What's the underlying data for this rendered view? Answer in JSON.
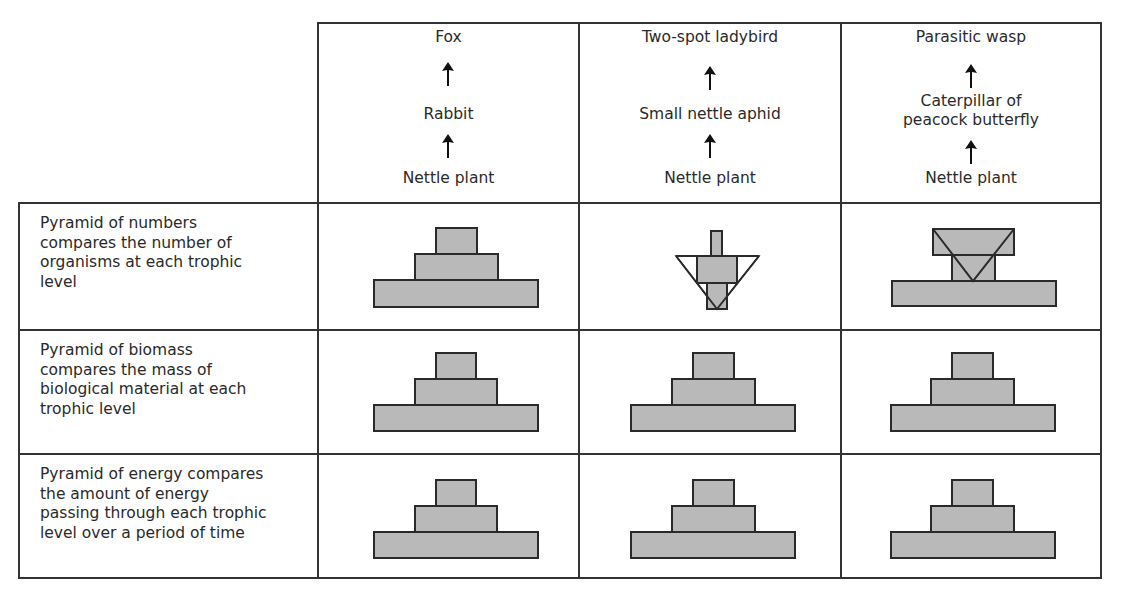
{
  "table": {
    "food_chains": [
      {
        "name": "chain-fox",
        "levels": [
          "Nettle plant",
          "Rabbit",
          "Fox"
        ]
      },
      {
        "name": "chain-ladybird",
        "levels": [
          "Nettle plant",
          "Small nettle aphid",
          "Two-spot ladybird"
        ]
      },
      {
        "name": "chain-wasp",
        "levels": [
          "Nettle plant",
          "Caterpillar of peacock butterfly",
          "Parasitic wasp"
        ],
        "display_lines": {
          "middle_line1": "Caterpillar of",
          "middle_line2": "peacock butterfly"
        }
      }
    ],
    "rows": [
      {
        "label": "Pyramid of numbers compares the number of organisms at each trophic level",
        "label_lines": [
          "Pyramid of numbers",
          "compares the number of",
          "organisms at each trophic",
          "level"
        ],
        "pyramids": [
          "upright",
          "inverted",
          "spindle-inverted"
        ]
      },
      {
        "label": "Pyramid of biomass compares the mass of biological material at each trophic level",
        "label_lines": [
          "Pyramid of biomass",
          "compares the mass of",
          "biological material at each",
          "trophic level"
        ],
        "pyramids": [
          "upright",
          "upright",
          "upright"
        ]
      },
      {
        "label": "Pyramid of energy compares the amount of energy passing through each trophic level over a period of time",
        "label_lines": [
          "Pyramid of energy compares",
          "the amount of energy",
          "passing through each trophic",
          "level over a period of time"
        ],
        "pyramids": [
          "upright",
          "upright",
          "upright"
        ]
      }
    ]
  },
  "colors": {
    "bar_fill": "#b9b9b9",
    "border": "#2a2a2a"
  }
}
